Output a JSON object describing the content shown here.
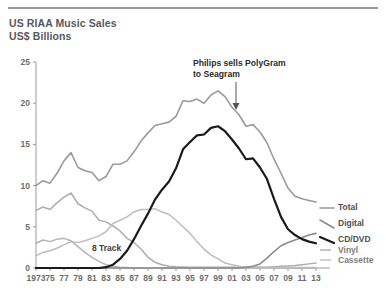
{
  "header": {
    "title_line1": "US RIAA Music Sales",
    "title_line2": "US$ Billions"
  },
  "annotation": {
    "line1": "Philips sells PolyGram",
    "line2": "to Seagram"
  },
  "inline_labels": {
    "eight_track": "8 Track"
  },
  "legend": {
    "items": [
      {
        "label": "Total",
        "color": "#9a9a9a"
      },
      {
        "label": "Digital",
        "color": "#8c8c8c"
      },
      {
        "label": "CD/DVD",
        "color": "#1a1a1a"
      },
      {
        "label": "Vinyl",
        "color": "#adadad"
      },
      {
        "label": "Cassette",
        "color": "#bdbdbd"
      }
    ]
  },
  "chart_data": {
    "type": "line",
    "title": "US RIAA Music Sales",
    "subtitle": "US$ Billions",
    "xlabel": "",
    "ylabel": "US$ Billions",
    "ylim": [
      0,
      25
    ],
    "yticks": [
      0,
      5,
      10,
      15,
      20,
      25
    ],
    "ytick_labels": [
      "0",
      "5",
      "10",
      "15",
      "20",
      "25"
    ],
    "xlim": [
      1973,
      2013
    ],
    "xticks": [
      1973,
      1975,
      1977,
      1979,
      1981,
      1983,
      1985,
      1987,
      1989,
      1991,
      1993,
      1995,
      1997,
      1999,
      2001,
      2003,
      2005,
      2007,
      2009,
      2011,
      2013
    ],
    "xtick_labels": [
      "1973",
      "75",
      "77",
      "79",
      "81",
      "83",
      "85",
      "87",
      "89",
      "91",
      "93",
      "95",
      "97",
      "99",
      "01",
      "03",
      "05",
      "07",
      "09",
      "11",
      "13"
    ],
    "grid": false,
    "legend_position": "right",
    "x": [
      1973,
      1974,
      1975,
      1976,
      1977,
      1978,
      1979,
      1980,
      1981,
      1982,
      1983,
      1984,
      1985,
      1986,
      1987,
      1988,
      1989,
      1990,
      1991,
      1992,
      1993,
      1994,
      1995,
      1996,
      1997,
      1998,
      1999,
      2000,
      2001,
      2002,
      2003,
      2004,
      2005,
      2006,
      2007,
      2008,
      2009,
      2010,
      2011,
      2012,
      2013
    ],
    "series": [
      {
        "name": "Total",
        "color": "#9a9a9a",
        "width": 1.6,
        "values": [
          10.0,
          10.6,
          10.3,
          11.5,
          13.0,
          14.0,
          12.2,
          11.8,
          11.6,
          10.6,
          11.1,
          12.6,
          12.6,
          13.0,
          14.1,
          15.4,
          16.4,
          17.3,
          17.5,
          17.7,
          18.4,
          20.3,
          20.2,
          20.5,
          20.0,
          21.0,
          21.5,
          20.8,
          19.5,
          18.6,
          17.2,
          17.4,
          16.5,
          15.2,
          13.2,
          11.5,
          9.7,
          8.7,
          8.4,
          8.2,
          8.0
        ]
      },
      {
        "name": "CD/DVD",
        "color": "#1a1a1a",
        "width": 2.2,
        "values": [
          0,
          0,
          0,
          0,
          0,
          0,
          0,
          0,
          0,
          0,
          0.1,
          0.4,
          1.1,
          2.1,
          3.5,
          5.1,
          6.6,
          8.3,
          9.5,
          10.5,
          12.1,
          14.4,
          15.3,
          16.1,
          16.2,
          17.0,
          17.2,
          16.6,
          15.6,
          14.5,
          13.2,
          13.3,
          12.2,
          10.8,
          8.4,
          6.2,
          4.7,
          4.0,
          3.5,
          3.2,
          3.0
        ]
      },
      {
        "name": "Cassette",
        "color": "#bdbdbd",
        "width": 1.5,
        "values": [
          1.5,
          1.9,
          2.1,
          2.4,
          2.8,
          3.2,
          3.1,
          3.3,
          3.6,
          3.9,
          4.4,
          5.4,
          5.8,
          6.2,
          6.8,
          7.1,
          7.1,
          7.2,
          6.8,
          6.5,
          5.8,
          5.0,
          4.2,
          3.2,
          2.3,
          1.6,
          1.1,
          0.6,
          0.4,
          0.2,
          0.1,
          0.1,
          0.1,
          0.05,
          0.05,
          0.05,
          0.05,
          0.05,
          0.05,
          0.05,
          0.05
        ]
      },
      {
        "name": "Vinyl",
        "color": "#adadad",
        "width": 1.5,
        "values": [
          7.0,
          7.4,
          7.1,
          7.9,
          8.6,
          9.1,
          7.8,
          7.3,
          6.9,
          5.8,
          5.6,
          5.1,
          4.5,
          3.6,
          3.1,
          2.3,
          1.3,
          0.7,
          0.4,
          0.2,
          0.15,
          0.12,
          0.1,
          0.1,
          0.1,
          0.1,
          0.1,
          0.1,
          0.1,
          0.1,
          0.1,
          0.1,
          0.1,
          0.1,
          0.15,
          0.2,
          0.25,
          0.3,
          0.4,
          0.5,
          0.6
        ]
      },
      {
        "name": "8 Track",
        "color": "#b5b5b5",
        "width": 1.5,
        "values": [
          3.0,
          3.4,
          3.2,
          3.5,
          3.6,
          3.3,
          2.6,
          1.9,
          1.3,
          0.8,
          0.4,
          0.2,
          0.1,
          0.05,
          0,
          0,
          0,
          0,
          0,
          0,
          0,
          0,
          0,
          0,
          0,
          0,
          0,
          0,
          0,
          0,
          0,
          0,
          0,
          0,
          0,
          0,
          0,
          0,
          0,
          0,
          0
        ]
      },
      {
        "name": "Digital",
        "color": "#8c8c8c",
        "width": 1.6,
        "values": [
          0,
          0,
          0,
          0,
          0,
          0,
          0,
          0,
          0,
          0,
          0,
          0,
          0,
          0,
          0,
          0,
          0,
          0,
          0,
          0,
          0,
          0,
          0,
          0,
          0,
          0,
          0,
          0,
          0,
          0,
          0.1,
          0.2,
          0.5,
          1.2,
          2.0,
          2.7,
          3.1,
          3.4,
          3.7,
          4.0,
          4.2
        ]
      }
    ],
    "annotations": [
      {
        "text": "Philips sells PolyGram to Seagram",
        "x": 1999,
        "y": 21.5
      },
      {
        "text": "8 Track",
        "x": 1980,
        "y": 1.6
      }
    ]
  }
}
